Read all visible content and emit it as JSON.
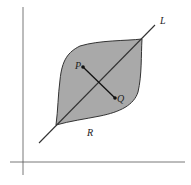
{
  "diagram": {
    "labels": {
      "line": "L",
      "point_p": "P",
      "point_q": "Q",
      "region": "R"
    },
    "colors": {
      "region_fill": "#a9a9a9",
      "stroke": "#333333",
      "axis": "#555555",
      "background": "#ffffff"
    }
  }
}
